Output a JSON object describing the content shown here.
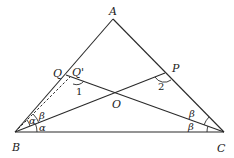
{
  "diagram": {
    "type": "triangle-angle-bisectors",
    "points": {
      "A": {
        "label": "A",
        "x": 113,
        "y": 19
      },
      "B": {
        "label": "B",
        "x": 15,
        "y": 132
      },
      "C": {
        "label": "C",
        "x": 224,
        "y": 132
      },
      "Q": {
        "label": "Q",
        "x": 66,
        "y": 75
      },
      "Qp": {
        "label": "Q'",
        "x": 71,
        "y": 76
      },
      "P": {
        "label": "P",
        "x": 165,
        "y": 73
      },
      "O": {
        "label": "O",
        "x": 118,
        "y": 96
      }
    },
    "segments": [
      "AB",
      "AC",
      "BC",
      "BP",
      "CQ'"
    ],
    "dashed_segments": [
      "BQ'"
    ],
    "angle_labels": {
      "angle1": "1",
      "angle2": "2",
      "alpha_upper": "α",
      "alpha_lower": "α",
      "beta_B": "β",
      "beta_C_upper": "β",
      "beta_C_lower": "β"
    }
  }
}
